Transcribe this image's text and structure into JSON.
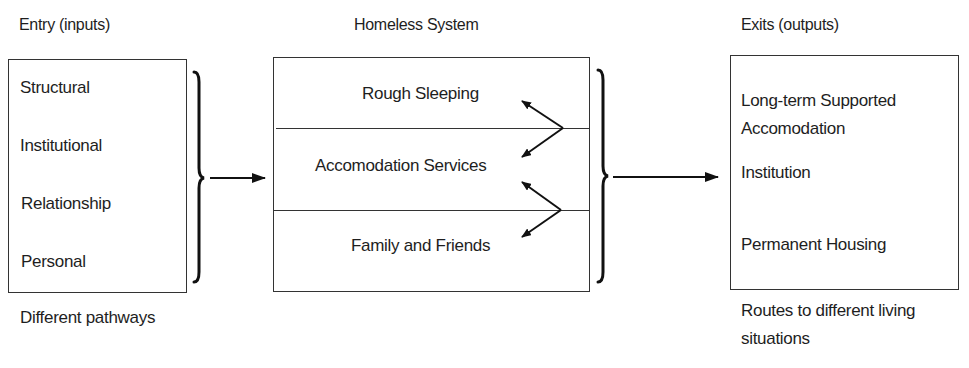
{
  "headers": {
    "entry": "Entry (inputs)",
    "system": "Homeless System",
    "exits": "Exits (outputs)"
  },
  "entry": {
    "items": [
      "Structural",
      "Institutional",
      "Relationship",
      "Personal"
    ],
    "caption": "Different pathways"
  },
  "system": {
    "layers": [
      "Rough Sleeping",
      "Accomodation Services",
      "Family and Friends"
    ]
  },
  "exits": {
    "items": [
      "Long-term Supported",
      "Accomodation",
      "Institution",
      "Permanent Housing"
    ],
    "caption_line1": "Routes to different living",
    "caption_line2": "situations"
  },
  "colors": {
    "stroke": "#333333",
    "arrow": "#111111",
    "text": "#1e1e1e"
  }
}
